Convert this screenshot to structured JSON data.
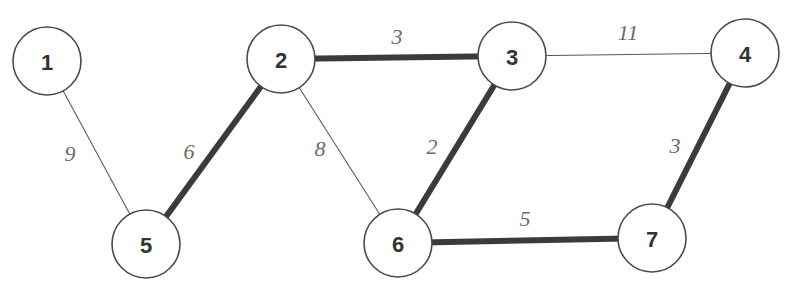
{
  "diagram": {
    "type": "weighted-undirected-graph",
    "colors": {
      "node_fill": "#ffffff",
      "node_stroke": "#4a4a4a",
      "node_text": "#333333",
      "thin_edge": "#5a5a5a",
      "thick_edge": "#3b3b3b",
      "edge_label": "#6a6a6a",
      "background": "#ffffff"
    },
    "nodes": [
      {
        "id": "1",
        "label": "1",
        "cx": 47,
        "cy": 61,
        "r": 34
      },
      {
        "id": "2",
        "label": "2",
        "cx": 281,
        "cy": 59,
        "r": 34
      },
      {
        "id": "3",
        "label": "3",
        "cx": 512,
        "cy": 56,
        "r": 34
      },
      {
        "id": "4",
        "label": "4",
        "cx": 745,
        "cy": 53,
        "r": 34
      },
      {
        "id": "5",
        "label": "5",
        "cx": 146,
        "cy": 244,
        "r": 34
      },
      {
        "id": "6",
        "label": "6",
        "cx": 398,
        "cy": 243,
        "r": 34
      },
      {
        "id": "7",
        "label": "7",
        "cx": 652,
        "cy": 238,
        "r": 34
      }
    ],
    "edges": [
      {
        "from": "1",
        "to": "5",
        "weight": "9",
        "highlighted": false,
        "label_x": 70,
        "label_y": 153
      },
      {
        "from": "5",
        "to": "2",
        "weight": "6",
        "highlighted": true,
        "label_x": 189,
        "label_y": 151
      },
      {
        "from": "2",
        "to": "3",
        "weight": "3",
        "highlighted": true,
        "label_x": 397,
        "label_y": 36
      },
      {
        "from": "2",
        "to": "6",
        "weight": "8",
        "highlighted": false,
        "label_x": 320,
        "label_y": 148
      },
      {
        "from": "3",
        "to": "6",
        "weight": "2",
        "highlighted": true,
        "label_x": 432,
        "label_y": 146
      },
      {
        "from": "3",
        "to": "4",
        "weight": "11",
        "highlighted": false,
        "label_x": 628,
        "label_y": 32
      },
      {
        "from": "6",
        "to": "7",
        "weight": "5",
        "highlighted": true,
        "label_x": 525,
        "label_y": 218
      },
      {
        "from": "4",
        "to": "7",
        "weight": "3",
        "highlighted": true,
        "label_x": 675,
        "label_y": 145
      }
    ]
  }
}
